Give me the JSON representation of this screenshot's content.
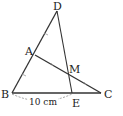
{
  "diagram": {
    "points": {
      "D": {
        "label": "D",
        "x": 57,
        "y": 11
      },
      "A": {
        "label": "A",
        "x": 35,
        "y": 55
      },
      "M": {
        "label": "M",
        "x": 69,
        "y": 75
      },
      "B": {
        "label": "B",
        "x": 12,
        "y": 93
      },
      "E": {
        "label": "E",
        "x": 72,
        "y": 93
      },
      "C": {
        "label": "C",
        "x": 101,
        "y": 93
      }
    },
    "segments": [
      "DB",
      "BC",
      "AC",
      "DE"
    ],
    "dimension": {
      "between": [
        "B",
        "E"
      ],
      "label": "10 cm"
    },
    "line_color": "#333333"
  }
}
